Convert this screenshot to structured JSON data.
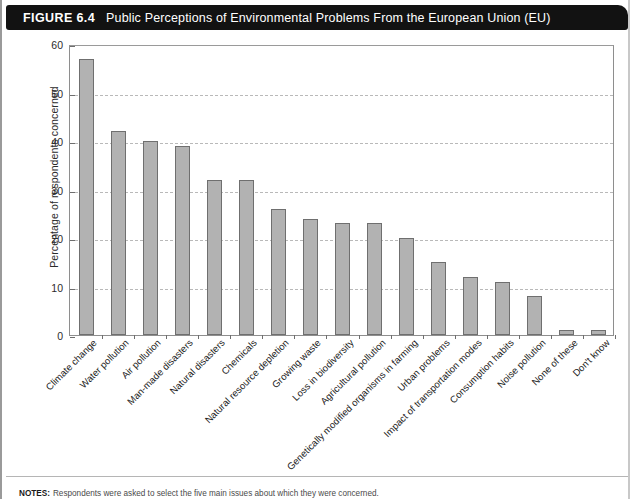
{
  "figure": {
    "number": "FIGURE 6.4",
    "title": "Public Perceptions of Environmental Problems From the European Union (EU)"
  },
  "notes": {
    "label": "NOTES:",
    "text": "Respondents were asked to select the five main issues about which they were concerned."
  },
  "colors": {
    "bar_fill": "#b2b2b2",
    "bar_stroke": "#6f6f6f",
    "gridline": "#b9b9b9",
    "axis": "#8e8e8e",
    "header_bg": "#121212",
    "header_text": "#ffffff"
  },
  "chart_data": {
    "type": "bar",
    "title": "Public Perceptions of Environmental Problems From the European Union (EU)",
    "xlabel": "",
    "ylabel": "Percentage of respondents concerned",
    "ylim": [
      0,
      60
    ],
    "yticks": [
      0,
      10,
      20,
      30,
      40,
      50,
      60
    ],
    "grid": true,
    "legend": "none",
    "categories": [
      "Climate change",
      "Water pollution",
      "Air pollution",
      "Man-made disasters",
      "Natural disasters",
      "Chemicals",
      "Natural resource depletion",
      "Growing waste",
      "Loss in biodiversity",
      "Agricultural pollution",
      "Genetically modified organisms in farming",
      "Urban problems",
      "Impact of transportation modes",
      "Consumption habits",
      "Noise pollution",
      "None of these",
      "Don't know"
    ],
    "values": [
      57,
      42,
      40,
      39,
      32,
      32,
      26,
      24,
      23,
      23,
      20,
      15,
      12,
      11,
      8,
      1,
      1
    ]
  }
}
